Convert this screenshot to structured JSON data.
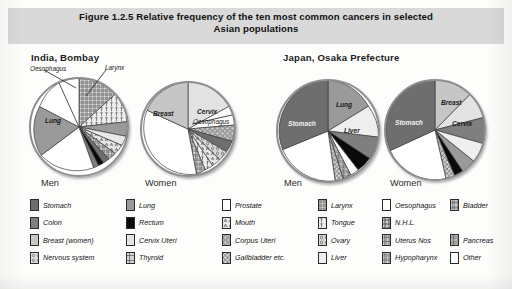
{
  "figure": {
    "title": "Figure 1.2.5  Relative frequency of the ten most common cancers in selected Asian populations",
    "title_line1": "Figure 1.2.5  Relative frequency of the ten most common cancers in selected",
    "title_line2": "Asian populations"
  },
  "panels": [
    {
      "heading": "India, Bombay",
      "men_label": "Men",
      "women_label": "Women",
      "men_callouts": [
        "Oesophagus",
        "Larynx"
      ],
      "men_inner_labels": [
        "Lung"
      ],
      "women_inner_labels": [
        "Breast",
        "Cervix"
      ],
      "women_callouts": [
        "Oesophagus"
      ]
    },
    {
      "heading": "Japan, Osaka Prefecture",
      "men_label": "Men",
      "women_label": "Women",
      "men_inner_labels": [
        "Stomach",
        "Lung",
        "Liver"
      ],
      "women_inner_labels": [
        "Stomach",
        "Breast",
        "Cervix"
      ],
      "men_callouts": [],
      "women_callouts": []
    }
  ],
  "legend": {
    "columns": [
      [
        {
          "label": "Stomach",
          "swatch": "solid-darkgrey",
          "color": "#6e6e6e"
        },
        {
          "label": "Colon",
          "swatch": "solid-midgrey",
          "color": "#7f7f7f"
        },
        {
          "label": "Breast (women)",
          "swatch": "solid-lightgrey",
          "color": "#c6c6c6"
        },
        {
          "label": "Nervous system",
          "swatch": "pattern-ns",
          "color": "#d8d8d8"
        }
      ],
      [
        {
          "label": "Lung",
          "swatch": "solid-grey",
          "color": "#9a9a9a"
        },
        {
          "label": "Rectum",
          "swatch": "solid-black",
          "color": "#0a0a0a"
        },
        {
          "label": "Cervix Uteri",
          "swatch": "solid-palegrey",
          "color": "#e3e3e3"
        },
        {
          "label": "Thyroid",
          "swatch": "pattern-thyroid",
          "color": "#cfcfcf"
        }
      ],
      [
        {
          "label": "Prostate",
          "swatch": "solid-white",
          "color": "#ffffff"
        },
        {
          "label": "Mouth",
          "swatch": "pattern-mouth",
          "color": "#e8e8e8"
        },
        {
          "label": "Corpus Uteri",
          "swatch": "pattern-corpus",
          "color": "#d5d5d5"
        },
        {
          "label": "Gallbladder etc.",
          "swatch": "pattern-gall",
          "color": "#d0d0d0"
        }
      ],
      [
        {
          "label": "Larynx",
          "swatch": "pattern-larynx",
          "color": "#cccccc"
        },
        {
          "label": "Tongue",
          "swatch": "pattern-tongue",
          "color": "#dddddd"
        },
        {
          "label": "Ovary",
          "swatch": "pattern-ovary",
          "color": "#d3d3d3"
        },
        {
          "label": "Liver",
          "swatch": "solid-verylight",
          "color": "#efefef"
        }
      ],
      [
        {
          "label": "Oesophagus",
          "swatch": "solid-white",
          "color": "#ffffff"
        },
        {
          "label": "N.H.L.",
          "swatch": "pattern-nhl",
          "color": "#bdbdbd"
        },
        {
          "label": "Uterus Nos",
          "swatch": "pattern-uterus",
          "color": "#c9c9c9"
        },
        {
          "label": "Hypopharynx",
          "swatch": "pattern-hypo",
          "color": "#c4c4c4"
        }
      ],
      [
        {
          "label": "Bladder",
          "swatch": "pattern-bladder",
          "color": "#cacaca"
        },
        {
          "label": "",
          "swatch": "none",
          "color": "transparent"
        },
        {
          "label": "Pancreas",
          "swatch": "pattern-pancreas",
          "color": "#c8c8c8"
        },
        {
          "label": "Other",
          "swatch": "solid-white",
          "color": "#ffffff"
        }
      ]
    ]
  },
  "chart_data": {
    "type": "pie",
    "title": "Relative frequency of the ten most common cancers in selected Asian populations",
    "legend_position": "bottom",
    "charts": [
      {
        "population": "India, Bombay",
        "sex": "Men",
        "slices": [
          {
            "label": "Larynx",
            "value": 13.0,
            "fill": "pattern-larynx"
          },
          {
            "label": "Tongue",
            "value": 9.0,
            "fill": "pattern-tongue"
          },
          {
            "label": "Lung",
            "value": 8.0,
            "fill": "solid-grey"
          },
          {
            "label": "Hypopharynx",
            "value": 7.0,
            "fill": "pattern-hypo"
          },
          {
            "label": "Mouth",
            "value": 7.0,
            "fill": "pattern-mouth"
          },
          {
            "label": "Stomach",
            "value": 5.0,
            "fill": "solid-darkgrey"
          },
          {
            "label": "Rectum",
            "value": 3.0,
            "fill": "solid-black"
          },
          {
            "label": "Colon",
            "value": 3.0,
            "fill": "solid-midgrey"
          },
          {
            "label": "Other",
            "value": 31.0,
            "fill": "solid-white"
          },
          {
            "label": "Lung",
            "value": 9.0,
            "fill": "solid-grey"
          },
          {
            "label": "Oesophagus",
            "value": 5.0,
            "fill": "solid-white"
          }
        ]
      },
      {
        "population": "India, Bombay",
        "sex": "Women",
        "slices": [
          {
            "label": "Cervix",
            "value": 18.0,
            "fill": "solid-palegrey"
          },
          {
            "label": "Oesophagus",
            "value": 6.0,
            "fill": "solid-white"
          },
          {
            "label": "Corpus Uteri",
            "value": 5.0,
            "fill": "pattern-corpus"
          },
          {
            "label": "Stomach",
            "value": 4.0,
            "fill": "solid-darkgrey"
          },
          {
            "label": "Ovary",
            "value": 5.0,
            "fill": "pattern-ovary"
          },
          {
            "label": "Mouth",
            "value": 5.0,
            "fill": "pattern-mouth"
          },
          {
            "label": "Tongue",
            "value": 4.0,
            "fill": "pattern-tongue"
          },
          {
            "label": "Other",
            "value": 31.0,
            "fill": "solid-white"
          },
          {
            "label": "Breast",
            "value": 22.0,
            "fill": "solid-lightgrey"
          }
        ]
      },
      {
        "population": "Japan, Osaka Prefecture",
        "sex": "Men",
        "slices": [
          {
            "label": "Lung",
            "value": 13.0,
            "fill": "solid-grey"
          },
          {
            "label": "Liver",
            "value": 10.0,
            "fill": "solid-verylight"
          },
          {
            "label": "Colon",
            "value": 7.0,
            "fill": "solid-midgrey"
          },
          {
            "label": "Rectum",
            "value": 5.0,
            "fill": "solid-black"
          },
          {
            "label": "Oesophagus",
            "value": 3.0,
            "fill": "solid-white"
          },
          {
            "label": "Pancreas",
            "value": 3.0,
            "fill": "pattern-pancreas"
          },
          {
            "label": "Gallbladder",
            "value": 3.0,
            "fill": "pattern-gall"
          },
          {
            "label": "Other",
            "value": 26.0,
            "fill": "solid-white"
          },
          {
            "label": "Stomach",
            "value": 30.0,
            "fill": "solid-darkgrey"
          }
        ]
      },
      {
        "population": "Japan, Osaka Prefecture",
        "sex": "Women",
        "slices": [
          {
            "label": "Breast",
            "value": 13.0,
            "fill": "solid-lightgrey"
          },
          {
            "label": "Cervix",
            "value": 9.0,
            "fill": "solid-palegrey"
          },
          {
            "label": "Colon",
            "value": 8.0,
            "fill": "solid-midgrey"
          },
          {
            "label": "Liver",
            "value": 6.0,
            "fill": "solid-verylight"
          },
          {
            "label": "Lung",
            "value": 6.0,
            "fill": "solid-grey"
          },
          {
            "label": "Rectum",
            "value": 4.0,
            "fill": "solid-black"
          },
          {
            "label": "Gallbladder",
            "value": 4.0,
            "fill": "pattern-gall"
          },
          {
            "label": "Other",
            "value": 25.0,
            "fill": "solid-white"
          },
          {
            "label": "Stomach",
            "value": 25.0,
            "fill": "solid-darkgrey"
          }
        ]
      }
    ]
  }
}
